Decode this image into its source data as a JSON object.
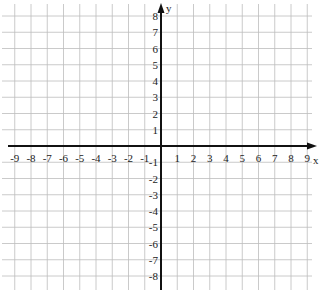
{
  "chart_data": {
    "type": "scatter",
    "title": "",
    "xlabel": "x",
    "ylabel": "y",
    "xlim": [
      -9,
      9
    ],
    "ylim": [
      -8,
      8
    ],
    "grid": true,
    "x_ticks": [
      -9,
      -8,
      -7,
      -6,
      -5,
      -4,
      -3,
      -2,
      -1,
      1,
      2,
      3,
      4,
      5,
      6,
      7,
      8,
      9
    ],
    "y_ticks": [
      8,
      7,
      6,
      5,
      4,
      3,
      2,
      1,
      -1,
      -2,
      -3,
      -4,
      -5,
      -6,
      -7,
      -8
    ],
    "series": [],
    "legend": null
  },
  "layout": {
    "origin_px": [
      161,
      146
    ],
    "unit_px": 16.25,
    "grid_color": "#bdbdbd",
    "axis_color": "#111111",
    "grid_extent_x": [
      -9.5,
      9.5
    ],
    "grid_extent_y": [
      -8.5,
      8.5
    ]
  }
}
